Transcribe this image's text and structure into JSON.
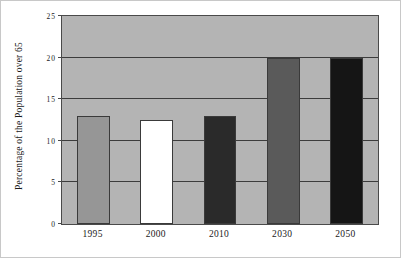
{
  "chart_data": {
    "type": "bar",
    "title": "",
    "xlabel": "",
    "ylabel": "Percentage of the Population over 65",
    "categories": [
      "1995",
      "2000",
      "2010",
      "2030",
      "2050"
    ],
    "values": [
      13,
      12.5,
      13,
      20,
      20
    ],
    "bar_colors": [
      "#969696",
      "#ffffff",
      "#2a2a2a",
      "#5a5a5a",
      "#151515"
    ],
    "ylim": [
      0,
      25
    ],
    "yticks": [
      0,
      5,
      10,
      15,
      20,
      25
    ],
    "ytick_labels": [
      "0",
      "5",
      "10",
      "15",
      "20",
      "25"
    ],
    "grid": true,
    "legend": "none",
    "plot_background": "#b4b4b4",
    "axis_color": "#4a4a4a",
    "frame_color": "#c8c8c8"
  }
}
